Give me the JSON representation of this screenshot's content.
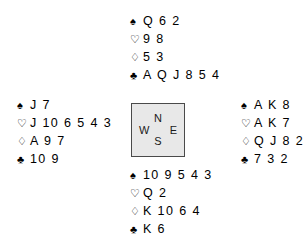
{
  "diagram": {
    "type": "bridge-deal",
    "suit_symbols": {
      "spade": "♠",
      "heart": "♡",
      "diamond": "♢",
      "club": "♣"
    },
    "compass": {
      "north": "N",
      "west": "W",
      "east": "E",
      "south": "S",
      "fill_color": "#e8e8e8",
      "border_color": "#4a4a4a"
    },
    "hands": {
      "north": {
        "label": "North",
        "spades": "Q 6 2",
        "hearts": "9 8",
        "diamonds": "5 3",
        "clubs": "A Q J 8 5 4"
      },
      "west": {
        "label": "West",
        "spades": "J 7",
        "hearts": "J 10 6 5 4 3",
        "diamonds": "A 9 7",
        "clubs": "10 9"
      },
      "east": {
        "label": "East",
        "spades": "A K 8",
        "hearts": "A K 7",
        "diamonds": "Q J 8 2",
        "clubs": "7 3 2"
      },
      "south": {
        "label": "South",
        "spades": "10 9 5 4 3",
        "hearts": "Q 2",
        "diamonds": "K 10 6 4",
        "clubs": "K 6"
      }
    }
  }
}
